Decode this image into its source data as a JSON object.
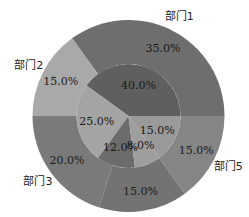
{
  "chart_data": {
    "type": "pie",
    "subtype": "nested-donut",
    "title": "",
    "startangle_deg": 0,
    "direction": "counterclockwise",
    "outer_ring": {
      "categories": [
        "部门1",
        "部门2",
        "部门3",
        "部门4",
        "部门5"
      ],
      "values": [
        35.0,
        15.0,
        20.0,
        15.0,
        15.0
      ],
      "labels": [
        "35.0%",
        "15.0%",
        "20.0%",
        "15.0%",
        "15.0%"
      ],
      "colors": [
        "#6e6e6e",
        "#a9a9a9",
        "#7a7a7a",
        "#737373",
        "#858585"
      ]
    },
    "inner_ring": {
      "values": [
        40.0,
        25.0,
        12.0,
        8.0,
        15.0
      ],
      "labels": [
        "40.0%",
        "25.0%",
        "12.0%",
        "8.0%",
        "15.0%"
      ],
      "colors": [
        "#5f5f5f",
        "#a4a4a4",
        "#6c6c6c",
        "#9e9e9e",
        "#9a9a9a"
      ]
    },
    "legend": null,
    "grid": false
  }
}
